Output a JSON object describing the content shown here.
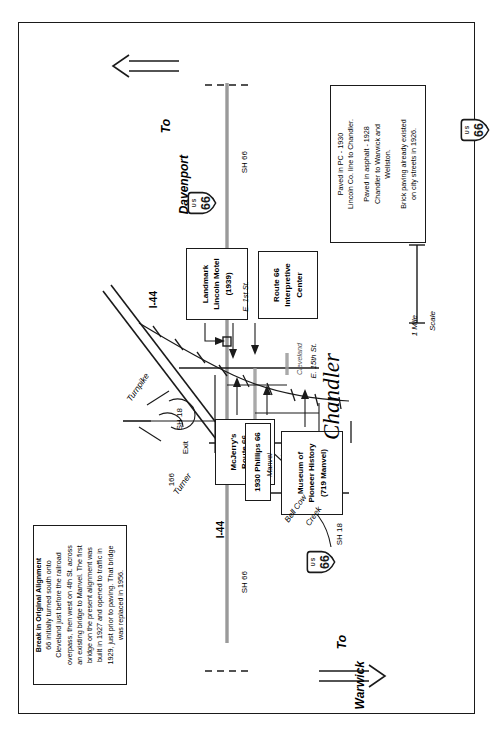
{
  "document": {
    "type": "historic-route-map",
    "subject": "Chandler, Oklahoma — U.S. Route 66 alignment map",
    "place_name": "Chandler"
  },
  "direction_arrows": [
    {
      "name": "to-davenport",
      "line1": "To",
      "line2": "Davenport"
    },
    {
      "name": "to-warwick",
      "line1": "To",
      "line2": "Warwick"
    }
  ],
  "notes": [
    {
      "id": "break-in-alignment",
      "title": "Break in Original Alignment",
      "lines": [
        "66 initially turned south onto",
        "Cleveland just before the railroad",
        "overpass, then west on 4th St. across",
        "an existing bridge to Manvel. The first",
        "bridge on the present alignment was",
        "built in 1927 and opened to traffic in",
        "1929, just prior to paving. That bridge",
        "was replaced in 1956."
      ]
    },
    {
      "id": "paving-history",
      "title": "",
      "lines": [
        "Paved in PC - 1930",
        "Lincoln Co. line to Chandler.",
        "",
        "Paved in asphalt - 1928",
        "Chandler to Warwick and",
        "Wellston.",
        "",
        "Brick paving already existed",
        "on city streets in 1926."
      ]
    }
  ],
  "site_labels": [
    {
      "id": "landmark-lincoln-motel",
      "lines": [
        "Landmark",
        "Lincoln Motel",
        "(1939)"
      ]
    },
    {
      "id": "route-66-interpretive-center",
      "lines": [
        "Route 66",
        "Interpretive",
        "Center"
      ]
    },
    {
      "id": "mcjerrys-route-66-gallery",
      "lines": [
        "McJerry's",
        "Route 66",
        "Gallery"
      ]
    },
    {
      "id": "1930-phillips-66",
      "lines": [
        "1930 Phillips 66"
      ]
    },
    {
      "id": "museum-of-pioneer-history",
      "lines": [
        "Museum of",
        "Pioneer History",
        "(719 Manvel)"
      ]
    }
  ],
  "road_labels": [
    {
      "id": "sh-66-north",
      "text": "SH 66"
    },
    {
      "id": "sh-66-south",
      "text": "SH 66"
    },
    {
      "id": "sh-18-north",
      "text": "SH 18"
    },
    {
      "id": "sh-18-south",
      "text": "SH 18"
    },
    {
      "id": "i-44-north",
      "text": "I-44"
    },
    {
      "id": "i-44-south",
      "text": "I-44"
    },
    {
      "id": "turnpike-north",
      "text": "Turnpike"
    },
    {
      "id": "turnpike-south",
      "text": "Turner"
    },
    {
      "id": "exit-166",
      "text": "Exit"
    },
    {
      "id": "exit-166-number",
      "text": "166"
    }
  ],
  "street_labels": [
    {
      "id": "e-1st-st",
      "text": "E. 1st St."
    },
    {
      "id": "e-15th-st",
      "text": "E. 15th St."
    },
    {
      "id": "cleveland",
      "text": "Cleveland"
    },
    {
      "id": "manvel",
      "text": "Manvel"
    }
  ],
  "water_labels": [
    {
      "id": "bell-cow-creek",
      "line1": "Bell Cow",
      "line2": "Creek"
    }
  ],
  "scale": {
    "id": "scale-bar",
    "distance": "1 Mile",
    "caption": "Scale"
  },
  "shields": [
    {
      "id": "us-66-shield-north",
      "top": "U S",
      "number": "66"
    },
    {
      "id": "us-66-shield-mid",
      "top": "U S",
      "number": "66"
    },
    {
      "id": "us-66-shield-south",
      "top": "U S",
      "number": "66"
    }
  ],
  "figure_caption": "",
  "colors": {
    "ink": "#1a1a1a",
    "road_gray": "#6b6b6b",
    "paper": "#ffffff"
  }
}
